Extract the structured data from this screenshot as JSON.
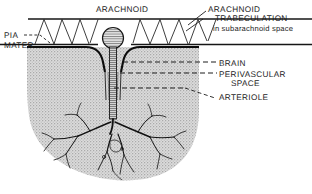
{
  "figure": {
    "background_color": "#ffffff",
    "ink_color": "#1d1d1d",
    "tissue_fill": "#c9c9c9"
  },
  "labels": {
    "arachnoid": "ARACHNOID",
    "pia_line1": "PIA",
    "pia_line2": "MATER",
    "trabeculation_line1": "ARACHNOID",
    "trabeculation_line2": "TRABECULATION",
    "trabeculation_line3": "in subarachnoid space",
    "brain": "BRAIN",
    "perivascular_line1": "PERIVASCULAR",
    "perivascular_line2": "SPACE",
    "arteriole": "ARTERIOLE"
  },
  "structures": [
    {
      "name": "arachnoid-membrane",
      "description": "horizontal double-line band across top of figure"
    },
    {
      "name": "arachnoid-trabeculations",
      "description": "angled strands spanning the subarachnoid space"
    },
    {
      "name": "pia-mater",
      "description": "dark membrane following the brain surface and dipping around the vessel"
    },
    {
      "name": "brain-tissue",
      "description": "stippled gray mass filling lower portion"
    },
    {
      "name": "arteriole-bulb",
      "description": "hatched round vessel head above the brain surface"
    },
    {
      "name": "arteriole-trunk",
      "description": "striated vessel descending into the brain"
    },
    {
      "name": "capillary-branches",
      "description": "root-like branching vessel network inside the brain"
    },
    {
      "name": "perivascular-space",
      "description": "narrow cleft flanking the descending vessel"
    }
  ]
}
